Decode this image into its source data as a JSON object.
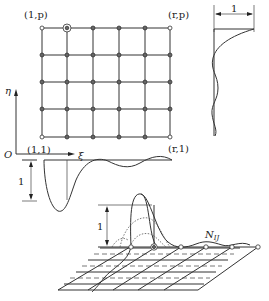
{
  "figure": {
    "grid": {
      "columns": 6,
      "rows": 5,
      "corner_labels": {
        "top_left": "(1,p)",
        "top_right": "(r,p)",
        "bottom_left": "(1,1)",
        "bottom_right": "(r,1)"
      },
      "highlighted_node": "column 2, top row"
    },
    "axes": {
      "origin": "O",
      "horizontal": "ξ",
      "vertical": "η"
    },
    "profiles": {
      "right_profile_scale_label": "1",
      "bottom_profile_scale_label": "1"
    },
    "surface": {
      "height_label": "1",
      "function_label_main": "N",
      "function_label_sub": "IJ"
    }
  }
}
